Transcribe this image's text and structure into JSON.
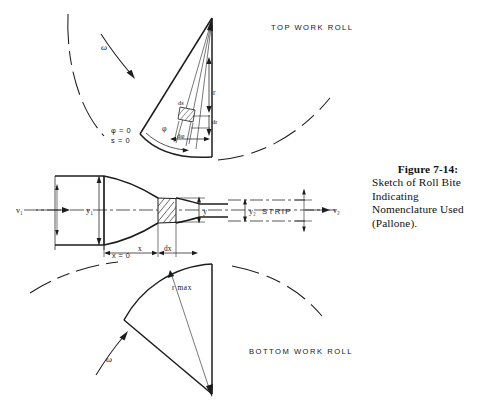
{
  "figure": {
    "title_top_roll": "TOP WORK ROLL",
    "title_bottom_roll": "BOTTOM WORK ROLL",
    "strip_label": "STRIP",
    "labels": {
      "omega_top": "ω",
      "omega_bottom": "ω",
      "phi_zero": "φ = 0",
      "s_zero": "s = 0",
      "phi": "φ",
      "d_phi": "dφ",
      "r": "r",
      "dr": "dr",
      "ds": "ds",
      "r_max": "r max",
      "v_entry": "v₁",
      "v_exit": "v₂",
      "y_entry": "y₁",
      "y_exit": "y₂",
      "y_mid": "y",
      "x_zero": "x = 0",
      "x": "x",
      "dx": "dx"
    },
    "colors": {
      "ink": "#1d1d1d",
      "paper": "#ffffff",
      "hatch": "#2a2a2a"
    }
  },
  "caption": {
    "figure_number": "Figure 7-14:",
    "text": "Sketch of Roll Bite Indicating Nomenclature Used (Pallone)."
  }
}
